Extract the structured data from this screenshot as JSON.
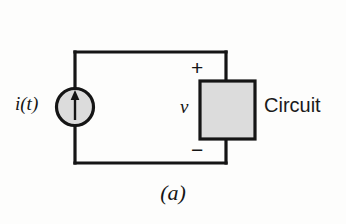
{
  "figure": {
    "caption": "(a)",
    "background_color": "#fdfdfc",
    "line_color": "#151515",
    "fill_color": "#dcdcdc"
  },
  "circuit": {
    "source": {
      "label": "i(t)",
      "symbol_name": "current-source",
      "arrow_direction": "up",
      "shape": "circle",
      "fill_color": "#dcdcdc",
      "stroke_color": "#151515"
    },
    "block": {
      "label": "Circuit",
      "shape": "rectangle",
      "fill_color": "#dcdcdc",
      "stroke_color": "#151515"
    },
    "voltage": {
      "label": "v",
      "plus": "+",
      "minus": "−"
    }
  }
}
